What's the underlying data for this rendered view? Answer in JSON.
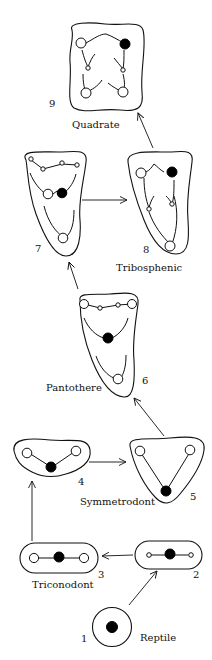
{
  "diagram": {
    "stages": [
      {
        "number": "1",
        "label": "Reptile"
      },
      {
        "number": "2",
        "label": ""
      },
      {
        "number": "3",
        "label": "Triconodont"
      },
      {
        "number": "4",
        "label": ""
      },
      {
        "number": "5",
        "label": "Symmetrodont"
      },
      {
        "number": "6",
        "label": "Pantothere"
      },
      {
        "number": "7",
        "label": ""
      },
      {
        "number": "8",
        "label": "Tribosphenic"
      },
      {
        "number": "9",
        "label": "Quadrate"
      }
    ],
    "arrows": [
      {
        "from": "1",
        "to": "2"
      },
      {
        "from": "2",
        "to": "3"
      },
      {
        "from": "3",
        "to": "4"
      },
      {
        "from": "4",
        "to": "5"
      },
      {
        "from": "5",
        "to": "6"
      },
      {
        "from": "6",
        "to": "7"
      },
      {
        "from": "7",
        "to": "8"
      },
      {
        "from": "8",
        "to": "9"
      }
    ],
    "colors": {
      "line": "#111111",
      "background": "#ffffff"
    }
  }
}
